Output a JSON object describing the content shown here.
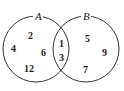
{
  "diagram": {
    "type": "venn",
    "sets": [
      {
        "name": "A",
        "label": "A",
        "circle": {
          "cx": 36,
          "cy": 49,
          "r": 33
        }
      },
      {
        "name": "B",
        "label": "B",
        "circle": {
          "cx": 86,
          "cy": 49,
          "r": 33
        }
      }
    ],
    "regions": {
      "only_A": [
        "2",
        "4",
        "6",
        "12"
      ],
      "A_and_B": [
        "1",
        "3"
      ],
      "only_B": [
        "5",
        "9",
        "7"
      ]
    },
    "positions": {
      "A_2": [
        30,
        36
      ],
      "A_4": [
        13,
        51
      ],
      "A_6": [
        43,
        55
      ],
      "A_12": [
        29,
        72
      ],
      "AB_1": [
        61,
        46
      ],
      "AB_3": [
        61,
        61
      ],
      "B_5": [
        87,
        41
      ],
      "B_9": [
        104,
        54
      ],
      "B_7": [
        85,
        72
      ]
    },
    "text": {
      "A_label": "A",
      "B_label": "B",
      "n2": "2",
      "n4": "4",
      "n6": "6",
      "n12": "12",
      "n1": "1",
      "n3": "3",
      "n5": "5",
      "n9": "9",
      "n7": "7"
    },
    "colors": {
      "stroke": "#333333",
      "text": "#222222",
      "background": "#ffffff"
    }
  }
}
